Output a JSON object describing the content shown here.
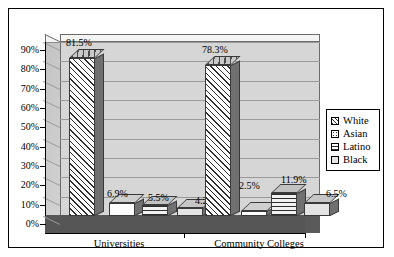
{
  "chart_data": {
    "type": "bar",
    "title": "",
    "subtitle": "",
    "xlabel": "",
    "ylabel": "",
    "categories": [
      "Universities",
      "Community Colleges"
    ],
    "series": [
      {
        "name": "White",
        "values": [
          81.5,
          78.3
        ],
        "pattern": "diagonal-hatch"
      },
      {
        "name": "Asian",
        "values": [
          6.9,
          2.5
        ],
        "pattern": "dotted"
      },
      {
        "name": "Latino",
        "values": [
          5.5,
          11.9
        ],
        "pattern": "horizontal-lines"
      },
      {
        "name": "Black",
        "values": [
          4.2,
          6.5
        ],
        "pattern": "solid-light"
      }
    ],
    "data_labels": [
      [
        "81.5%",
        "6.9%",
        "5.5%",
        "4.2%"
      ],
      [
        "78.3%",
        "2.5%",
        "11.9%",
        "6.5%"
      ]
    ],
    "ylim": [
      0,
      90
    ],
    "ytick_step": 10,
    "ytick_labels": [
      "90%",
      "80%",
      "70%",
      "60%",
      "50%",
      "40%",
      "30%",
      "20%",
      "10%",
      "0%"
    ],
    "grid": true,
    "legend_position": "right",
    "style": "3d-clustered-column",
    "colors": {
      "plot_wall": "#d6d6d6",
      "floor": "#565656",
      "gridline": "#9a9a9a",
      "axis": "#000000",
      "frame_border": "#000000",
      "background": "#ffffff"
    }
  },
  "yaxis": {
    "ticks": [
      {
        "label": "90%",
        "value": 90
      },
      {
        "label": "80%",
        "value": 80
      },
      {
        "label": "70%",
        "value": 70
      },
      {
        "label": "60%",
        "value": 60
      },
      {
        "label": "50%",
        "value": 50
      },
      {
        "label": "40%",
        "value": 40
      },
      {
        "label": "30%",
        "value": 30
      },
      {
        "label": "20%",
        "value": 20
      },
      {
        "label": "10%",
        "value": 10
      },
      {
        "label": "0%",
        "value": 0
      }
    ]
  },
  "xaxis": {
    "categories": [
      {
        "label": "Universities"
      },
      {
        "label": "Community Colleges"
      }
    ]
  },
  "legend": {
    "items": [
      {
        "label": "White"
      },
      {
        "label": "Asian"
      },
      {
        "label": "Latino"
      },
      {
        "label": "Black"
      }
    ]
  },
  "groups": [
    {
      "category": "Universities",
      "bars": [
        {
          "series": "White",
          "label": "81.5%",
          "value": 81.5
        },
        {
          "series": "Asian",
          "label": "6.9%",
          "value": 6.9
        },
        {
          "series": "Latino",
          "label": "5.5%",
          "value": 5.5
        },
        {
          "series": "Black",
          "label": "4.2%",
          "value": 4.2
        }
      ]
    },
    {
      "category": "Community Colleges",
      "bars": [
        {
          "series": "White",
          "label": "78.3%",
          "value": 78.3
        },
        {
          "series": "Asian",
          "label": "2.5%",
          "value": 2.5
        },
        {
          "series": "Latino",
          "label": "11.9%",
          "value": 11.9
        },
        {
          "series": "Black",
          "label": "6.5%",
          "value": 6.5
        }
      ]
    }
  ]
}
